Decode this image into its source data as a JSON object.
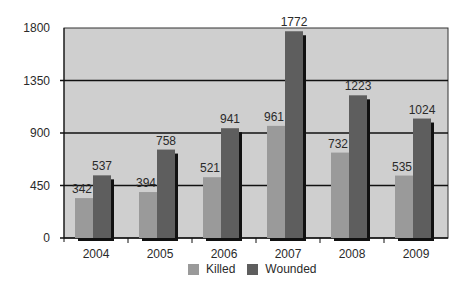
{
  "chart_data": {
    "type": "bar",
    "title": "",
    "xlabel": "",
    "ylabel": "",
    "categories": [
      "2004",
      "2005",
      "2006",
      "2007",
      "2008",
      "2009"
    ],
    "series": [
      {
        "name": "Killed",
        "values": [
          342,
          394,
          521,
          961,
          732,
          535
        ],
        "color": "#9a9a9a"
      },
      {
        "name": "Wounded",
        "values": [
          537,
          758,
          941,
          1772,
          1223,
          1024
        ],
        "color": "#5e5e5e"
      }
    ],
    "ylim": [
      0,
      1800
    ],
    "yticks": [
      0,
      450,
      900,
      1350,
      1800
    ],
    "grid": true,
    "data_labels": true,
    "legend_position": "bottom"
  },
  "legend": {
    "killed_label": "Killed",
    "wounded_label": "Wounded"
  },
  "colors": {
    "plot_background": "#cfcfcf",
    "killed": "#9a9a9a",
    "wounded": "#5e5e5e",
    "shadow": "#111111"
  }
}
